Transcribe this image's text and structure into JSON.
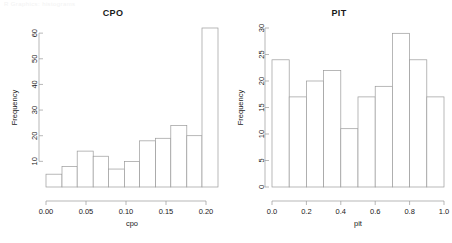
{
  "figure": {
    "top_note": "R Graphics: histograms",
    "background_color": "#ffffff",
    "bar_stroke_color": "#9a9a9a",
    "bar_fill_color": "#ffffff",
    "axis_color": "#9a9a9a",
    "text_color": "#1a1a1a"
  },
  "panels": [
    {
      "id": "cpo",
      "title": "CPO",
      "y_axis_label": "Frequency",
      "x_axis_label": "cpo"
    },
    {
      "id": "pit",
      "title": "PIT",
      "y_axis_label": "Frequency",
      "x_axis_label": "pit"
    }
  ],
  "chart_data": [
    {
      "type": "bar",
      "id": "cpo",
      "title": "CPO",
      "xlabel": "cpo",
      "ylabel": "Frequency",
      "grid": false,
      "legend": "none",
      "xlim": [
        0.0,
        0.215
      ],
      "ylim": [
        0,
        62
      ],
      "xticks": [
        0.0,
        0.05,
        0.1,
        0.15,
        0.2
      ],
      "xticklabels": [
        "0.00",
        "0.05",
        "0.10",
        "0.15",
        "0.20"
      ],
      "yticks": [
        10,
        20,
        30,
        40,
        50,
        60
      ],
      "yticklabels": [
        "10",
        "20",
        "30",
        "40",
        "50",
        "60"
      ],
      "bin_edges": [
        0.0,
        0.02,
        0.039,
        0.059,
        0.078,
        0.098,
        0.117,
        0.137,
        0.156,
        0.176,
        0.195,
        0.215
      ],
      "categories": [
        "0.000-0.020",
        "0.020-0.039",
        "0.039-0.059",
        "0.059-0.078",
        "0.078-0.098",
        "0.098-0.117",
        "0.117-0.137",
        "0.137-0.156",
        "0.156-0.176",
        "0.176-0.195",
        "0.195-0.215"
      ],
      "values": [
        5,
        8,
        14,
        12,
        7,
        10,
        18,
        19,
        24,
        20,
        62
      ]
    },
    {
      "type": "bar",
      "id": "pit",
      "title": "PIT",
      "xlabel": "pit",
      "ylabel": "Frequency",
      "grid": false,
      "legend": "none",
      "xlim": [
        0.0,
        1.0
      ],
      "ylim": [
        0,
        30
      ],
      "xticks": [
        0.0,
        0.2,
        0.4,
        0.6,
        0.8,
        1.0
      ],
      "xticklabels": [
        "0.0",
        "0.2",
        "0.4",
        "0.6",
        "0.8",
        "1.0"
      ],
      "yticks": [
        0,
        5,
        10,
        15,
        20,
        25,
        30
      ],
      "yticklabels": [
        "0",
        "5",
        "10",
        "15",
        "20",
        "25",
        "30"
      ],
      "bin_edges": [
        0.0,
        0.1,
        0.2,
        0.3,
        0.4,
        0.5,
        0.6,
        0.7,
        0.8,
        0.9,
        1.0
      ],
      "categories": [
        "0.0-0.1",
        "0.1-0.2",
        "0.2-0.3",
        "0.3-0.4",
        "0.4-0.5",
        "0.5-0.6",
        "0.6-0.7",
        "0.7-0.8",
        "0.8-0.9",
        "0.9-1.0"
      ],
      "values": [
        24,
        17,
        20,
        22,
        11,
        17,
        19,
        29,
        24,
        17
      ]
    }
  ]
}
